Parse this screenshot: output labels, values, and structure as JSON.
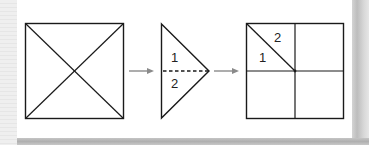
{
  "diagram": {
    "colors": {
      "stroke": "#1a1a1a",
      "arrow": "#8a8a8a",
      "card": "#ffffff",
      "background": "#ececec"
    },
    "panels": [
      {
        "id": "square-with-diagonals",
        "shape": "square",
        "lines": [
          "diagonal-tl-br",
          "diagonal-tr-bl"
        ]
      },
      {
        "id": "folded-triangle",
        "shape": "triangle",
        "labels": {
          "top": "1",
          "bottom": "2"
        },
        "fold_line": "dashed"
      },
      {
        "id": "quartered-square",
        "shape": "square",
        "lines": [
          "vertical-mid",
          "horizontal-mid",
          "diagonal-top-left-quadrant"
        ],
        "labels": {
          "upper": "2",
          "lower": "1"
        }
      }
    ],
    "arrows": [
      {
        "from": "square-with-diagonals",
        "to": "folded-triangle"
      },
      {
        "from": "folded-triangle",
        "to": "quartered-square"
      }
    ]
  }
}
